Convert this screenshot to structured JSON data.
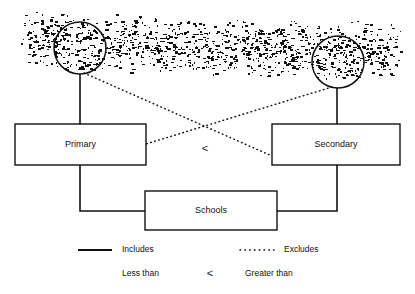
{
  "figure": {
    "background_color": "#ffffff",
    "ink_color": "#111111"
  },
  "nodes": [
    {
      "id": "primary",
      "label": "Primary",
      "x": 15,
      "y": 124,
      "w": 131,
      "h": 41
    },
    {
      "id": "secondary",
      "label": "Secondary",
      "x": 272,
      "y": 124,
      "w": 128,
      "h": 41
    },
    {
      "id": "schools",
      "label": "Schools",
      "x": 145,
      "y": 191,
      "w": 132,
      "h": 39
    }
  ],
  "circles": [
    {
      "id": "left-circle",
      "cx": 80,
      "cy": 48,
      "r": 26
    },
    {
      "id": "right-circle",
      "cx": 338,
      "cy": 62,
      "r": 26
    }
  ],
  "noise_band": {
    "description": "speckled scanned halftone band",
    "x": 14,
    "y": 8,
    "w": 388,
    "h": 74,
    "seed": 20240517,
    "density": 1900
  },
  "comparison_symbol": {
    "glyph": "<",
    "x": 205,
    "y": 149
  },
  "legend": {
    "rows": [
      {
        "items": [
          {
            "id": "includes",
            "marker": "solid-line",
            "label": "Includes",
            "marker_x1": 78,
            "marker_x2": 112,
            "label_x": 122,
            "y": 250
          },
          {
            "id": "excludes",
            "marker": "dotted-line",
            "label": "Excludes",
            "marker_x1": 240,
            "marker_x2": 274,
            "label_x": 284,
            "y": 250
          }
        ]
      },
      {
        "items": [
          {
            "id": "less-than",
            "marker": "none",
            "label": "Less than",
            "label_x": 122,
            "y": 274
          },
          {
            "id": "cmp-glyph",
            "marker": "cmp-glyph",
            "label": "<",
            "label_x": 210,
            "y": 274
          },
          {
            "id": "greater-than",
            "marker": "none",
            "label": "Greater than",
            "label_x": 245,
            "y": 274
          }
        ]
      }
    ]
  },
  "links": [
    {
      "id": "left-circle-to-primary",
      "type": "solid",
      "d": "M80,74 L80,124"
    },
    {
      "id": "right-circle-to-secondary",
      "type": "solid",
      "d": "M337,88 L337,124"
    },
    {
      "id": "primary-to-schools",
      "type": "solid",
      "d": "M80,165 L80,211 L145,211"
    },
    {
      "id": "secondary-to-schools",
      "type": "solid",
      "d": "M337,165 L337,211 L277,211"
    },
    {
      "id": "left-circle-to-secondary",
      "type": "dotted",
      "d": "M84,73 L272,156"
    },
    {
      "id": "right-circle-to-primary",
      "type": "dotted",
      "d": "M332,87 L146,144"
    }
  ]
}
